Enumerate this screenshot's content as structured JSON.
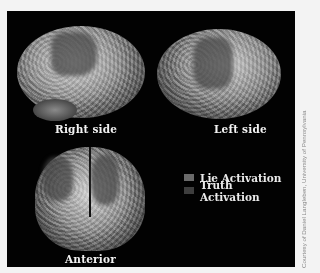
{
  "figure": {
    "views": [
      {
        "label": "Right side"
      },
      {
        "label": "Left side"
      },
      {
        "label": "Anterior"
      }
    ],
    "legend": [
      {
        "label": "Lie Activation",
        "color": "#6a6a6a"
      },
      {
        "label": "Truth Activation",
        "color": "#3e3e3e"
      }
    ],
    "credit": "Courtesy of Daniel Langleben, University of Pennsylvania",
    "colors": {
      "background": "#020202",
      "page": "#f3f3f3"
    }
  }
}
